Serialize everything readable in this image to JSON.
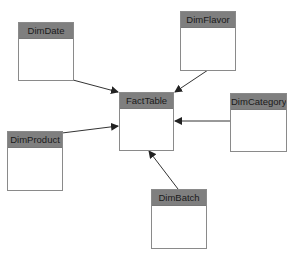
{
  "diagram": {
    "type": "star-schema",
    "center": "FactTable",
    "entities": [
      {
        "id": "dimdate",
        "label": "DimDate"
      },
      {
        "id": "dimflavor",
        "label": "DimFlavor"
      },
      {
        "id": "facttable",
        "label": "FactTable"
      },
      {
        "id": "dimcategory",
        "label": "DimCategory"
      },
      {
        "id": "dimproduct",
        "label": "DimProduct"
      },
      {
        "id": "dimbatch",
        "label": "DimBatch"
      }
    ],
    "relationships": [
      {
        "from": "DimDate",
        "to": "FactTable"
      },
      {
        "from": "DimFlavor",
        "to": "FactTable"
      },
      {
        "from": "DimCategory",
        "to": "FactTable"
      },
      {
        "from": "DimProduct",
        "to": "FactTable"
      },
      {
        "from": "DimBatch",
        "to": "FactTable"
      }
    ],
    "colors": {
      "header_fill": "#7f7f7f",
      "border": "#8a8a8a",
      "arrow": "#222222",
      "background": "#ffffff"
    }
  }
}
